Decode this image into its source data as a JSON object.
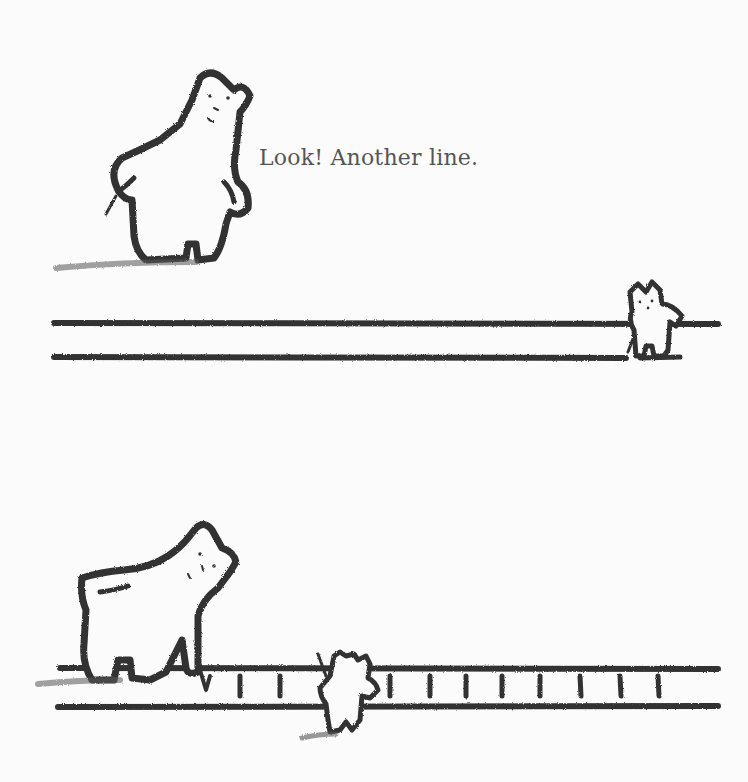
{
  "page": {
    "caption": "Look! Another line.",
    "ink_color": "#333333",
    "text_color": "#555555",
    "background": "#fbfbfb"
  },
  "scenes": [
    {
      "name": "top-scene",
      "characters": [
        "big-bear-standing",
        "small-bear-at-line-end"
      ],
      "lines": 2
    },
    {
      "name": "bottom-scene",
      "characters": [
        "big-bear-stepping-on-ladder",
        "small-bear-climbing-through-ladder"
      ],
      "rails": 2,
      "rungs": 10
    }
  ]
}
